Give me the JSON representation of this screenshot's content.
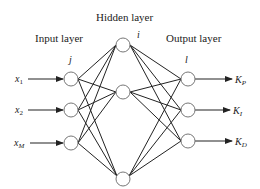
{
  "diagram": {
    "title_hidden": "Hidden layer",
    "title_input": "Input layer",
    "title_output": "Output layer",
    "index_input": "j",
    "index_hidden": "i",
    "index_output": "l",
    "inputs": [
      {
        "label": "x",
        "sub": "1"
      },
      {
        "label": "x",
        "sub": "2"
      },
      {
        "label": "x",
        "sub": "M"
      }
    ],
    "outputs": [
      {
        "label": "K",
        "sub": "P"
      },
      {
        "label": "K",
        "sub": "I"
      },
      {
        "label": "K",
        "sub": "D"
      }
    ],
    "colors": {
      "line": "#222222",
      "node_fill": "#ffffff",
      "node_stroke": "#777777"
    }
  }
}
